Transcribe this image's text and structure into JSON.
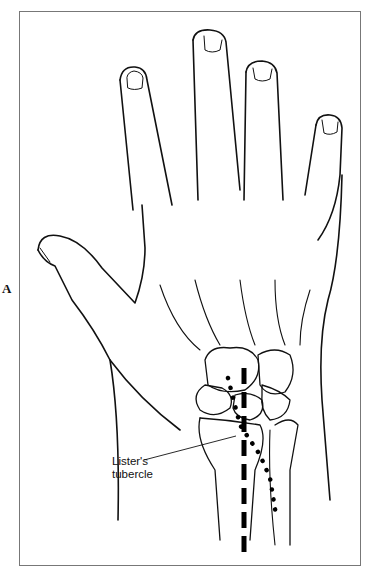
{
  "figure": {
    "panel_label": "A",
    "callouts": [
      {
        "line1": "Lister's",
        "line2": "tubercle"
      }
    ],
    "markers": [
      {
        "name": "dashed-line",
        "style": "long dashes",
        "color": "#000000"
      },
      {
        "name": "dotted-line",
        "style": "round dots",
        "color": "#000000"
      }
    ],
    "colors": {
      "stroke": "#111111",
      "frame": "#777777",
      "background": "#ffffff"
    }
  }
}
